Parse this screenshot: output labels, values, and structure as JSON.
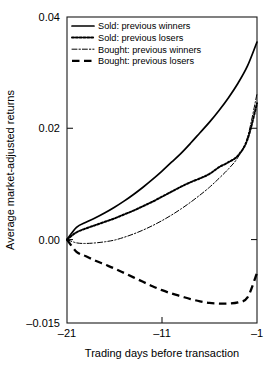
{
  "chart_data": {
    "type": "line",
    "title": "",
    "xlabel": "Trading days before transaction",
    "ylabel": "Average market-adjusted returns",
    "xlim": [
      -21,
      -1
    ],
    "ylim": [
      -0.015,
      0.04
    ],
    "xticks": [
      -21,
      -11,
      -1
    ],
    "xticklabels": [
      "–21",
      "–11",
      "–1"
    ],
    "yticks": [
      0.04,
      0.02,
      0.0,
      -0.015
    ],
    "yticklabels": [
      "0.04",
      "0.02",
      "0.00",
      "–0.015"
    ],
    "grid": false,
    "legend_position": "top-left",
    "x": [
      -21,
      -20,
      -19,
      -18,
      -17,
      -16,
      -15,
      -14,
      -13,
      -12,
      -11,
      -10,
      -9,
      -8,
      -7,
      -6,
      -5,
      -4,
      -3,
      -2,
      -1
    ],
    "series": [
      {
        "name": "Sold: previous winners",
        "style": "solid",
        "color": "#000000",
        "values": [
          0.0,
          0.0022,
          0.0031,
          0.0039,
          0.0048,
          0.0058,
          0.0069,
          0.0081,
          0.0094,
          0.0108,
          0.0123,
          0.0139,
          0.0155,
          0.0173,
          0.0192,
          0.0211,
          0.0232,
          0.0255,
          0.0281,
          0.0312,
          0.0355
        ]
      },
      {
        "name": "Sold: previous losers",
        "style": "dotted",
        "color": "#000000",
        "values": [
          0.0,
          0.0013,
          0.002,
          0.0026,
          0.0032,
          0.0038,
          0.0045,
          0.0052,
          0.006,
          0.0068,
          0.0077,
          0.0086,
          0.0095,
          0.0103,
          0.011,
          0.0118,
          0.013,
          0.0139,
          0.0151,
          0.018,
          0.0245
        ]
      },
      {
        "name": "Bought: previous winners",
        "style": "dashdot",
        "color": "#000000",
        "values": [
          0.0,
          -0.0006,
          -0.0007,
          -0.0006,
          -0.0004,
          -0.0001,
          0.0004,
          0.001,
          0.0017,
          0.0025,
          0.0034,
          0.0044,
          0.0055,
          0.0067,
          0.008,
          0.0094,
          0.011,
          0.0127,
          0.0148,
          0.0184,
          0.0262
        ]
      },
      {
        "name": "Bought: previous losers",
        "style": "dashed",
        "color": "#000000",
        "values": [
          0.0,
          -0.0022,
          -0.003,
          -0.0038,
          -0.0045,
          -0.0052,
          -0.006,
          -0.0068,
          -0.0076,
          -0.0084,
          -0.0091,
          -0.0097,
          -0.0102,
          -0.0107,
          -0.0111,
          -0.0114,
          -0.0115,
          -0.0115,
          -0.0113,
          -0.0104,
          -0.006
        ]
      }
    ]
  },
  "legend": {
    "items": [
      {
        "label": "Sold: previous winners"
      },
      {
        "label": "Sold: previous losers"
      },
      {
        "label": "Bought: previous winners"
      },
      {
        "label": "Bought: previous losers"
      }
    ]
  }
}
